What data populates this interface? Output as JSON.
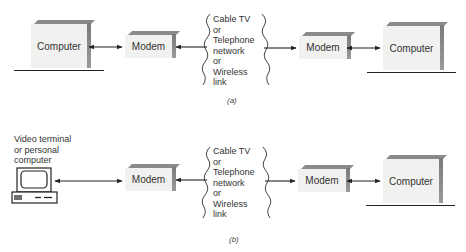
{
  "diagram": {
    "panel_a": {
      "caption": "(a)",
      "left_node": {
        "label": "Computer"
      },
      "left_modem": {
        "label": "Modem"
      },
      "network": {
        "lines": [
          "Cable TV",
          "or",
          "Telephone",
          "network",
          "or",
          "Wireless",
          "link"
        ]
      },
      "right_modem": {
        "label": "Modem"
      },
      "right_node": {
        "label": "Computer"
      }
    },
    "panel_b": {
      "caption": "(b)",
      "left_node": {
        "label_lines": [
          "Video terminal",
          "or personal",
          "computer"
        ]
      },
      "left_modem": {
        "label": "Modem"
      },
      "network": {
        "lines": [
          "Cable TV",
          "or",
          "Telephone",
          "network",
          "or",
          "Wireless",
          "link"
        ]
      },
      "right_modem": {
        "label": "Modem"
      },
      "right_node": {
        "label": "Computer"
      }
    },
    "colors": {
      "box_face": "#f1f1ef",
      "box_shade": "#7a7a7a",
      "line": "#222222"
    }
  }
}
